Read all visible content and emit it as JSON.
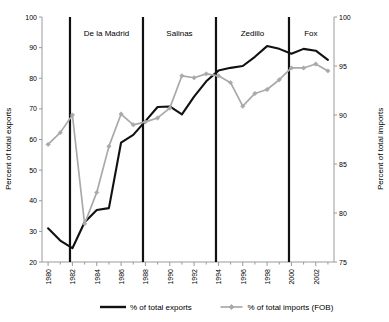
{
  "chart_data": {
    "type": "line",
    "title": "",
    "xlabel": "",
    "ylabel": "Percent of total exports",
    "y2label": "Percent of total imports",
    "grid": false,
    "legend_position": "bottom",
    "x": [
      1980,
      1981,
      1982,
      1983,
      1984,
      1985,
      1986,
      1987,
      1988,
      1989,
      1990,
      1991,
      1992,
      1993,
      1994,
      1995,
      1996,
      1997,
      1998,
      1999,
      2000,
      2001,
      2002,
      2003
    ],
    "xlim": [
      1979.5,
      2003.5
    ],
    "xtick_labels": [
      "1980",
      "1982",
      "1984",
      "1986",
      "1988",
      "1990",
      "1992",
      "1994",
      "1996",
      "1998",
      "2000",
      "2002"
    ],
    "xtick_values": [
      1980,
      1982,
      1984,
      1986,
      1988,
      1990,
      1992,
      1994,
      1996,
      1998,
      2000,
      2002
    ],
    "xtick_minor_step": 1,
    "ylim": [
      20,
      100
    ],
    "ytick_labels": [
      "20",
      "30",
      "40",
      "50",
      "60",
      "70",
      "80",
      "90",
      "100"
    ],
    "ytick_values": [
      20,
      30,
      40,
      50,
      60,
      70,
      80,
      90,
      100
    ],
    "y2lim": [
      75,
      100
    ],
    "y2tick_labels": [
      "75",
      "80",
      "85",
      "90",
      "95",
      "100"
    ],
    "y2tick_values": [
      75,
      80,
      85,
      90,
      95,
      100
    ],
    "series": [
      {
        "name": "% of total exports",
        "axis": "left",
        "color": "#111111",
        "marker": "none",
        "values": [
          31.0,
          27.0,
          24.5,
          33.0,
          37.0,
          37.6,
          59.0,
          61.5,
          66.0,
          70.6,
          70.8,
          68.2,
          74.0,
          79.0,
          82.5,
          83.4,
          84.0,
          87.0,
          90.5,
          89.6,
          88.0,
          89.6,
          89.0,
          86.0
        ]
      },
      {
        "name": "% of total imports (FOB)",
        "axis": "right",
        "color": "#a9a9a9",
        "marker": "diamond",
        "values": [
          87.0,
          88.2,
          90.0,
          78.9,
          82.1,
          86.8,
          90.1,
          89.0,
          89.3,
          89.7,
          90.7,
          94.0,
          93.8,
          94.2,
          94.0,
          93.3,
          90.9,
          92.2,
          92.6,
          93.6,
          94.8,
          94.8,
          95.2,
          94.5
        ]
      }
    ],
    "annotations": [
      {
        "label": "De la Madrid",
        "x_start": 1981.8,
        "x_end": 1987.8,
        "x_center": 1984.8
      },
      {
        "label": "Salinas",
        "x_start": 1987.8,
        "x_end": 1993.8,
        "x_center": 1990.8
      },
      {
        "label": "Zedillo",
        "x_start": 1993.8,
        "x_end": 1999.8,
        "x_center": 1996.8
      },
      {
        "label": "Fox",
        "x_start": 1999.8,
        "x_end": 2003.5,
        "x_center": 2001.6
      }
    ],
    "dividers": [
      1981.8,
      1987.8,
      1993.8,
      1999.8
    ],
    "legend": [
      {
        "label": "% of total exports",
        "color": "#111111",
        "marker": "none"
      },
      {
        "label": "% of total imports (FOB)",
        "color": "#a9a9a9",
        "marker": "diamond"
      }
    ]
  }
}
